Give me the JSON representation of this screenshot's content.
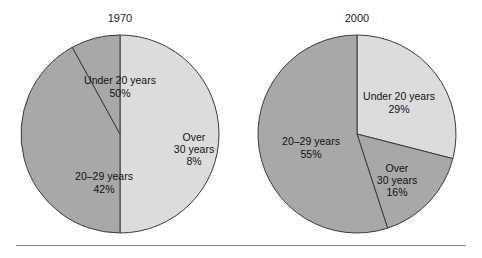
{
  "figure": {
    "width": 482,
    "height": 258,
    "background": "#ffffff",
    "rule_color": "#8a8a8a",
    "outline_color": "#3a3a3a"
  },
  "palette": {
    "light_gray": "#dcdcdc",
    "dark_gray": "#a8a8a8",
    "text": "#111111"
  },
  "chart_data": [
    {
      "type": "pie",
      "title": "1970",
      "center": [
        120,
        134
      ],
      "radius": 99,
      "start_angle_deg": -90,
      "direction": "clockwise",
      "categories": [
        "Under 20 years",
        "20–29 years",
        "Over 30 years"
      ],
      "values": [
        50,
        42,
        8
      ],
      "unit": "%",
      "colors": [
        "#dcdcdc",
        "#a8a8a8",
        "#a8a8a8"
      ],
      "slices": [
        {
          "label": "Under 20 years",
          "value": 50,
          "value_text": "50%",
          "color": "#dcdcdc",
          "label_x": 120,
          "label_y": 84,
          "pct_x": 120,
          "pct_y": 97
        },
        {
          "label": "20–29 years",
          "value": 42,
          "value_text": "42%",
          "color": "#a8a8a8",
          "label_x": 104,
          "label_y": 180,
          "pct_x": 104,
          "pct_y": 193
        },
        {
          "label_line1": "Over",
          "label_line2": "30 years",
          "label": "Over 30 years",
          "value": 8,
          "value_text": "8%",
          "color": "#a8a8a8",
          "label_x": 194,
          "label_y": 141,
          "label2_x": 194,
          "label2_y": 153,
          "pct_x": 194,
          "pct_y": 165
        }
      ],
      "legend": "none",
      "grid": false
    },
    {
      "type": "pie",
      "title": "2000",
      "center": [
        357,
        134
      ],
      "radius": 99,
      "start_angle_deg": -90,
      "direction": "clockwise",
      "categories": [
        "Under 20 years",
        "Over 30 years",
        "20–29 years"
      ],
      "values": [
        29,
        16,
        55
      ],
      "unit": "%",
      "colors": [
        "#dcdcdc",
        "#a8a8a8",
        "#a8a8a8"
      ],
      "slices": [
        {
          "label": "Under 20 years",
          "value": 29,
          "value_text": "29%",
          "color": "#dcdcdc",
          "label_x": 399,
          "label_y": 100,
          "pct_x": 399,
          "pct_y": 113
        },
        {
          "label_line1": "Over",
          "label_line2": "30 years",
          "label": "Over 30 years",
          "value": 16,
          "value_text": "16%",
          "color": "#a8a8a8",
          "label_x": 397,
          "label_y": 172,
          "label2_x": 397,
          "label2_y": 184,
          "pct_x": 397,
          "pct_y": 196
        },
        {
          "label": "20–29 years",
          "value": 55,
          "value_text": "55%",
          "color": "#a8a8a8",
          "label_x": 311,
          "label_y": 145,
          "pct_x": 311,
          "pct_y": 158
        }
      ],
      "legend": "none",
      "grid": false
    }
  ]
}
